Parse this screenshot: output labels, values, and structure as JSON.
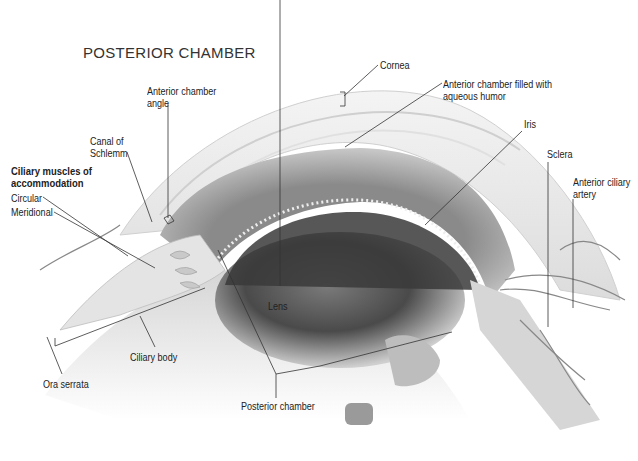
{
  "title": "POSTERIOR CHAMBER",
  "labels": {
    "anterior_chamber_angle": [
      "Anterior chamber",
      "angle"
    ],
    "canal_of_schlemm": [
      "Canal of",
      "Schlemm"
    ],
    "ciliary_muscles": [
      "Ciliary muscles of",
      "accommodation"
    ],
    "circular": "Circular",
    "meridional": "Meridional",
    "cornea": "Cornea",
    "anterior_chamber": [
      "Anterior chamber filled with",
      "aqueous humor"
    ],
    "iris": "Iris",
    "sclera": "Sclera",
    "anterior_ciliary_artery": [
      "Anterior ciliary",
      "artery"
    ],
    "lens": "Lens",
    "ciliary_body": "Ciliary body",
    "ora_serrata": "Ora serrata",
    "posterior_chamber": "Posterior chamber"
  },
  "colors": {
    "leader_line": "#333333",
    "tissue_light": "#e6e6e6",
    "tissue_mid": "#a8a8a8",
    "pupil_dark": "#3a3a3a"
  }
}
